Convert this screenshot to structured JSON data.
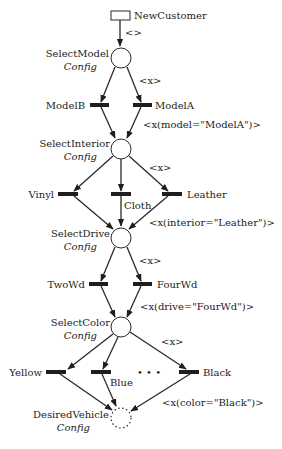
{
  "diagram": {
    "type": "petri-net",
    "start": {
      "label": "NewCustomer"
    },
    "places": [
      {
        "name": "SelectModel",
        "type": "Config"
      },
      {
        "name": "SelectInterior",
        "type": "Config"
      },
      {
        "name": "SelectDrive",
        "type": "Config"
      },
      {
        "name": "SelectColor",
        "type": "Config"
      },
      {
        "name": "DesiredVehicle",
        "type": "Config"
      }
    ],
    "transitions": {
      "model": [
        "ModelB",
        "ModelA"
      ],
      "interior": [
        "Vinyl",
        "Cloth",
        "Leather"
      ],
      "drive": [
        "TwoWd",
        "FourWd"
      ],
      "color": [
        "Yellow",
        "Blue",
        "Black"
      ],
      "ellipsis": "• • •"
    },
    "arc_labels": {
      "start_out": "<>",
      "model_in": "<x>",
      "model_out": "<x(model=\"ModelA\")>",
      "interior_in": "<x>",
      "interior_out": "<x(interior=\"Leather\")>",
      "drive_in": "<x>",
      "drive_out": "<x(drive=\"FourWd\")>",
      "color_in": "<x>",
      "color_out": "<x(color=\"Black\")>"
    }
  }
}
